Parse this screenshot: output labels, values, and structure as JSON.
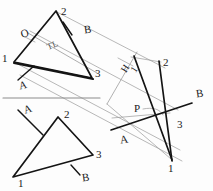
{
  "drawing": {
    "title": "Descriptive Geometry Triangle Projection Sketch",
    "colors": {
      "object_line": "#1a1a1a",
      "projection_line": "#9a9a9a",
      "reference_line": "#8c8c8c",
      "background": "#fdfdfd"
    },
    "views": [
      {
        "name": "top-view-triangle",
        "vertex_labels": [
          "1",
          "2",
          "3"
        ],
        "plane_labels": [
          "O",
          "A",
          "B"
        ],
        "true_length_label": "TL"
      },
      {
        "name": "front-view-triangle",
        "vertex_labels": [
          "1",
          "2",
          "3"
        ],
        "plane_labels": [
          "A",
          "B"
        ]
      },
      {
        "name": "auxiliary-view-triangle",
        "vertex_labels": [
          "1",
          "2",
          "3"
        ],
        "plane_labels": [
          "A",
          "B"
        ],
        "point_label": "P",
        "fold_line_label": "H",
        "fold_line_sub": "1"
      }
    ],
    "labels": {
      "top_v1": "1",
      "top_v2": "2",
      "top_v3": "3",
      "top_o": "O",
      "top_a": "A",
      "top_b": "B",
      "top_tl": "TL",
      "front_v1": "1",
      "front_v2": "2",
      "front_v3": "3",
      "front_a": "A",
      "front_b": "B",
      "aux_v1": "1",
      "aux_v2": "2",
      "aux_v3": "3",
      "aux_a": "A",
      "aux_b": "B",
      "aux_p": "P",
      "fold_h": "H",
      "fold_one": "1"
    }
  }
}
